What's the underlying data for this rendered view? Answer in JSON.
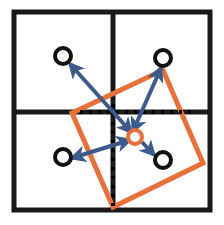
{
  "figure": {
    "canvas": {
      "width": 224,
      "height": 225,
      "background": "#ffffff"
    },
    "colors": {
      "grid": "#1a1a1a",
      "dotted_guide": "#000000",
      "sample_point_stroke": "#111111",
      "center_point_stroke": "#e8703a",
      "deformed_box": "#e8703a",
      "offset_arrow": "#3d5a8c",
      "page_background": "#ffffff"
    },
    "grid": {
      "name": "receptive-field-grid",
      "left": 14,
      "top": 12,
      "right": 210,
      "bottom": 210,
      "stroke_width": 5,
      "v_divider_x": 113,
      "h_divider_y": 112,
      "cells": 4
    },
    "dotted_guides": [
      {
        "name": "horizontal-guide",
        "orientation": "horizontal",
        "y": 112,
        "x1": 80,
        "x2": 192,
        "dash": "3,6",
        "stroke_width": 4
      },
      {
        "name": "vertical-guide",
        "orientation": "vertical",
        "x": 113,
        "y1": 104,
        "y2": 208,
        "dash": "3,6",
        "stroke_width": 4
      }
    ],
    "deformed_box": {
      "name": "deformed-sampling-box",
      "points": "72,113 163,70 203,163 113,207",
      "stroke_width": 5,
      "rotation_deg": -25
    },
    "center_point": {
      "name": "center-sample-point",
      "cx": 135,
      "cy": 137,
      "r": 7,
      "stroke_width": 4
    },
    "sample_points": [
      {
        "name": "sample-point-top-left",
        "cx": 63,
        "cy": 56,
        "r": 8,
        "stroke_width": 4
      },
      {
        "name": "sample-point-top-right",
        "cx": 163,
        "cy": 58,
        "r": 8,
        "stroke_width": 4
      },
      {
        "name": "sample-point-bottom-left",
        "cx": 63,
        "cy": 157,
        "r": 8,
        "stroke_width": 4
      },
      {
        "name": "sample-point-bottom-right",
        "cx": 163,
        "cy": 160,
        "r": 8,
        "stroke_width": 4
      }
    ],
    "offset_arrows": [
      {
        "name": "offset-arrow-top-left",
        "x1": 131,
        "y1": 132,
        "x2": 70,
        "y2": 64,
        "double_headed": true,
        "stroke_width": 4
      },
      {
        "name": "offset-arrow-top-right",
        "x1": 133,
        "y1": 131,
        "x2": 161,
        "y2": 68,
        "double_headed": true,
        "stroke_width": 4
      },
      {
        "name": "offset-arrow-bottom-left",
        "x1": 130,
        "y1": 140,
        "x2": 72,
        "y2": 158,
        "double_headed": true,
        "stroke_width": 4
      },
      {
        "name": "offset-arrow-bottom-right",
        "x1": 142,
        "y1": 142,
        "x2": 154,
        "y2": 155,
        "double_headed": false,
        "stroke_width": 4
      }
    ]
  }
}
